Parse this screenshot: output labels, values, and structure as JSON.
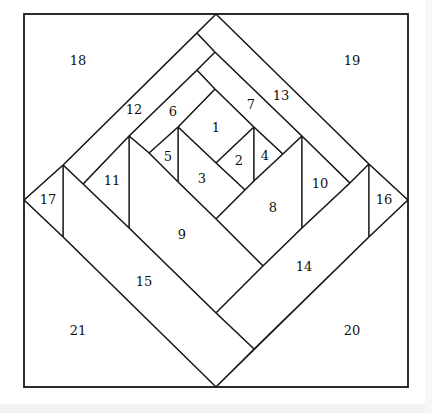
{
  "diagram": {
    "type": "quilt-block-foundation-piecing-pattern",
    "frame": {
      "x": 24,
      "y": 14,
      "width": 384,
      "height": 373
    },
    "stroke_color": "#1a1a1a",
    "fill_color": "#ffffff",
    "pieces": [
      {
        "id": "1",
        "label": "1",
        "points": "215,89 254,127 216,163 178,127",
        "label_pos": [
          216,
          127
        ]
      },
      {
        "id": "2",
        "label": "2",
        "points": "216,163 254,127 254,181 245,190",
        "label_pos": [
          239,
          160
        ]
      },
      {
        "id": "3",
        "label": "3",
        "points": "178,127 216,163 245,190 216,219 178,182",
        "label_pos": [
          202,
          178
        ]
      },
      {
        "id": "4",
        "label": "4",
        "points": "254,127 283,154 254,181",
        "label_pos": [
          265,
          155
        ]
      },
      {
        "id": "5",
        "label": "5",
        "points": "178,127 178,182 149,153",
        "label_pos": [
          168,
          156
        ]
      },
      {
        "id": "6",
        "label": "6",
        "points": "197,70 215,89 178,127 149,153 129,136",
        "label_pos": [
          173,
          111
        ]
      },
      {
        "id": "7",
        "label": "7",
        "points": "215,52 302,136 283,154 254,127 215,89 197,70",
        "label_pos": [
          251,
          104
        ]
      },
      {
        "id": "8",
        "label": "8",
        "points": "216,219 245,190 254,181 283,154 302,136 302,228 263,266",
        "label_pos": [
          273,
          207
        ]
      },
      {
        "id": "9",
        "label": "9",
        "points": "129,136 149,153 178,182 216,219 263,266 216,313 129,228",
        "label_pos": [
          182,
          234
        ]
      },
      {
        "id": "10",
        "label": "10",
        "points": "302,136 350,183 302,228",
        "label_pos": [
          320,
          183
        ]
      },
      {
        "id": "11",
        "label": "11",
        "points": "83,184 129,136 129,228",
        "label_pos": [
          112,
          180
        ]
      },
      {
        "id": "12",
        "label": "12",
        "points": "197,33 215,52 197,70 129,136 83,184 63,165",
        "label_pos": [
          134,
          109
        ]
      },
      {
        "id": "13",
        "label": "13",
        "points": "216,14 369,164 350,183 302,136 215,52 197,33",
        "label_pos": [
          281,
          95
        ]
      },
      {
        "id": "14",
        "label": "14",
        "points": "216,313 263,266 302,228 350,183 369,164 369,237 254,349",
        "label_pos": [
          304,
          266
        ]
      },
      {
        "id": "15",
        "label": "15",
        "points": "63,165 83,184 129,228 216,313 254,349 216,387 63,237",
        "label_pos": [
          144,
          281
        ]
      },
      {
        "id": "16",
        "label": "16",
        "points": "369,164 408,200 369,237",
        "label_pos": [
          384,
          199
        ]
      },
      {
        "id": "17",
        "label": "17",
        "points": "24,200 63,165 63,237",
        "label_pos": [
          48,
          199
        ]
      },
      {
        "id": "18",
        "label": "18",
        "points": "24,14 216,14 63,165 24,200",
        "label_pos": [
          78,
          60
        ]
      },
      {
        "id": "19",
        "label": "19",
        "points": "216,14 408,14 408,200 369,164",
        "label_pos": [
          352,
          60
        ]
      },
      {
        "id": "20",
        "label": "20",
        "points": "216,387 369,237 408,200 408,387",
        "label_pos": [
          352,
          330
        ]
      },
      {
        "id": "21",
        "label": "21",
        "points": "24,200 63,237 216,387 24,387",
        "label_pos": [
          78,
          330
        ]
      }
    ]
  }
}
